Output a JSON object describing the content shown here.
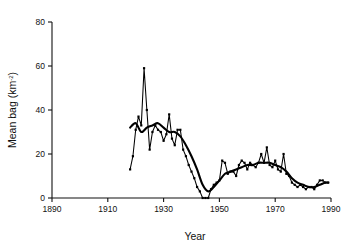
{
  "chart_data": {
    "type": "line",
    "title": "",
    "xlabel": "Year",
    "ylabel": "Mean bag (km-2)",
    "ylabel_base": "Mean bag (km",
    "ylabel_sup": "-2",
    "ylabel_tail": ")",
    "xlim": [
      1890,
      1990
    ],
    "ylim": [
      0,
      80
    ],
    "xticks": [
      1890,
      1910,
      1930,
      1950,
      1970,
      1990
    ],
    "yticks": [
      0,
      20,
      40,
      60,
      80
    ],
    "grid": false,
    "legend": null,
    "line_color": "#000000",
    "marker": "square",
    "series": [
      {
        "name": "Annual mean bag",
        "style": "markers-and-line",
        "x": [
          1918,
          1919,
          1920,
          1921,
          1922,
          1923,
          1924,
          1925,
          1926,
          1927,
          1928,
          1929,
          1930,
          1931,
          1932,
          1933,
          1934,
          1935,
          1936,
          1937,
          1938,
          1939,
          1940,
          1941,
          1942,
          1943,
          1944,
          1945,
          1946,
          1947,
          1948,
          1949,
          1950,
          1951,
          1952,
          1953,
          1954,
          1955,
          1956,
          1957,
          1958,
          1959,
          1960,
          1961,
          1962,
          1963,
          1964,
          1965,
          1966,
          1967,
          1968,
          1969,
          1970,
          1971,
          1972,
          1973,
          1974,
          1975,
          1976,
          1977,
          1978,
          1979,
          1980,
          1981,
          1982,
          1983,
          1984,
          1985,
          1986,
          1987,
          1988,
          1989
        ],
        "y": [
          13,
          19,
          31,
          37,
          33,
          59,
          40,
          22,
          30,
          33,
          31,
          30,
          26,
          29,
          38,
          27,
          24,
          31,
          31,
          22,
          19,
          15,
          12,
          9,
          5,
          3,
          0,
          0,
          0,
          4,
          6,
          7,
          8,
          17,
          16,
          11,
          12,
          12,
          10,
          15,
          17,
          16,
          13,
          16,
          15,
          14,
          16,
          20,
          16,
          23,
          15,
          14,
          17,
          13,
          12,
          20,
          11,
          10,
          7,
          6,
          5,
          6,
          5,
          4,
          5,
          5,
          4,
          6,
          8,
          8,
          7,
          7
        ]
      },
      {
        "name": "Smoothed trend",
        "style": "smooth-line",
        "x": [
          1918,
          1920,
          1922,
          1924,
          1926,
          1928,
          1930,
          1932,
          1934,
          1936,
          1938,
          1940,
          1942,
          1944,
          1946,
          1948,
          1950,
          1952,
          1954,
          1956,
          1958,
          1960,
          1962,
          1964,
          1966,
          1968,
          1970,
          1972,
          1974,
          1976,
          1978,
          1980,
          1982,
          1984,
          1986,
          1988,
          1989
        ],
        "y": [
          32,
          34,
          30,
          32,
          33,
          34,
          32,
          30,
          30,
          28,
          24,
          19,
          13,
          6,
          3,
          5,
          8,
          11,
          12,
          13,
          14,
          15,
          15,
          16,
          16,
          16,
          15,
          14,
          12,
          9,
          7,
          6,
          5,
          5,
          6,
          7,
          7
        ]
      }
    ],
    "annotations": []
  },
  "figure": {
    "background": "#ffffff",
    "axis_color": "#111111"
  }
}
